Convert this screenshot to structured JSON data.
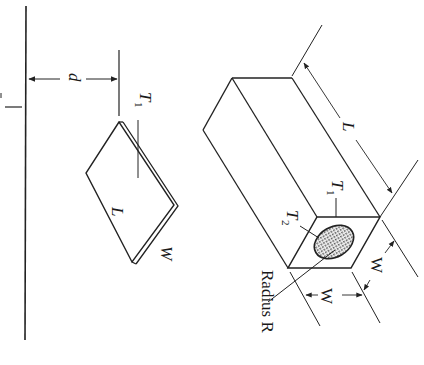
{
  "diagram": {
    "type": "technical-illustration",
    "orientation": "rotated 90 degrees counter-clockwise",
    "labels": {
      "distance": "d",
      "plate_temp": "T",
      "plate_temp_sub": "1",
      "plate_length": "L",
      "plate_width": "W",
      "box_length": "L",
      "box_temp1": "T",
      "box_temp1_sub": "1",
      "box_temp2": "T",
      "box_temp2_sub": "2",
      "box_width_a": "W",
      "box_width_b": "W",
      "radius": "Radius R"
    },
    "colors": {
      "line": "#222222",
      "background": "#ffffff",
      "hatch": "#888888"
    }
  }
}
